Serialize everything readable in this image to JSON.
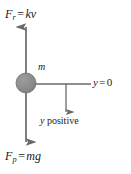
{
  "figure": {
    "background_color": "#ffffff",
    "line_color": "#5a5a5a",
    "text_color": "#1a1a1a",
    "mass_fill_color": "#8c8c8c",
    "mass_stroke_color": "#5a5a5a"
  },
  "labels": {
    "resistive_force": {
      "symbol": "F",
      "subscript": "r",
      "equals": "=",
      "expression_coefficient": "k",
      "expression_variable": "v",
      "full_text": "F_r = kv"
    },
    "weight_force": {
      "symbol": "F",
      "subscript": "p",
      "equals": "=",
      "expression_mass": "m",
      "expression_gravity": "g",
      "full_text": "F_p = mg"
    },
    "mass": {
      "symbol": "m",
      "full_text": "m"
    },
    "datum": {
      "variable": "y",
      "equals": "=",
      "value": "0",
      "full_text": "y = 0"
    },
    "positive_direction": {
      "variable": "y",
      "word": "positive",
      "full_text": "y positive"
    }
  },
  "geometry": {
    "mass_center_x": 26,
    "mass_center_y": 83,
    "mass_radius": 10,
    "vertical_axis_x": 26,
    "up_arrow_tip_y": 26,
    "down_arrow_tip_y": 143,
    "horizontal_line_y": 84,
    "horizontal_line_end_x": 91,
    "positive_arrow_x": 66,
    "positive_arrow_tip_y": 113
  }
}
